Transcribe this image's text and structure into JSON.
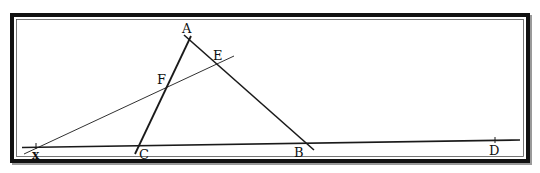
{
  "figure": {
    "type": "geometry-diagram",
    "colors": {
      "stroke": "#1a1a1a",
      "frame": "#111111",
      "frame_shadow": "#8a8a8a",
      "background": "#ffffff"
    },
    "frame": {
      "x": 12,
      "y": 15,
      "width": 516,
      "height": 146
    },
    "points": {
      "A": {
        "label": "A",
        "x": 189,
        "y": 39
      },
      "B": {
        "label": "B",
        "x": 306,
        "y": 142
      },
      "C": {
        "label": "C",
        "x": 140,
        "y": 145
      },
      "D": {
        "label": "D",
        "x": 495,
        "y": 141
      },
      "E": {
        "label": "E",
        "x": 218,
        "y": 63
      },
      "F": {
        "label": "F",
        "x": 167,
        "y": 87
      },
      "x": {
        "label": "x",
        "x": 36,
        "y": 146
      }
    },
    "segments": [
      {
        "name": "baseline-xD",
        "from": "x",
        "to": "D"
      },
      {
        "name": "side-CA",
        "from": "C",
        "to": "A"
      },
      {
        "name": "side-AB",
        "from": "A",
        "to": "B"
      },
      {
        "name": "transversal-xFE",
        "from": "x",
        "to": "E"
      }
    ]
  }
}
